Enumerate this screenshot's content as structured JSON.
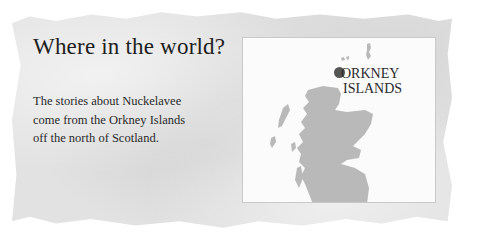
{
  "title": "Where in the world?",
  "body_lines": [
    "The stories about Nuckelavee",
    "come from the Orkney Islands",
    "off the north of Scotland."
  ],
  "map": {
    "label_lines": [
      "ORKNEY",
      "ISLANDS"
    ],
    "marker_color": "#555555",
    "land_color": "#b9b9b9",
    "region": "Scotland"
  }
}
